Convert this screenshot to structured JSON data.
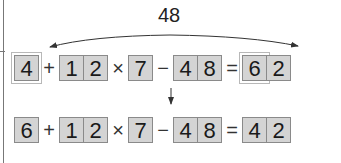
{
  "arc_label": "48",
  "top_equation": {
    "tokens": [
      {
        "type": "num",
        "digits": [
          "4"
        ],
        "highlighted": true
      },
      {
        "type": "op",
        "value": "+"
      },
      {
        "type": "num",
        "digits": [
          "1",
          "2"
        ]
      },
      {
        "type": "op",
        "value": "×"
      },
      {
        "type": "num",
        "digits": [
          "7"
        ]
      },
      {
        "type": "op",
        "value": "−"
      },
      {
        "type": "num",
        "digits": [
          "4",
          "8"
        ]
      },
      {
        "type": "op",
        "value": "="
      },
      {
        "type": "num",
        "digits": [
          "6",
          "2"
        ],
        "highlighted_digit": 0
      }
    ]
  },
  "bottom_equation": {
    "tokens": [
      {
        "type": "num",
        "digits": [
          "6"
        ]
      },
      {
        "type": "op",
        "value": "+"
      },
      {
        "type": "num",
        "digits": [
          "1",
          "2"
        ]
      },
      {
        "type": "op",
        "value": "×"
      },
      {
        "type": "num",
        "digits": [
          "7"
        ]
      },
      {
        "type": "op",
        "value": "−"
      },
      {
        "type": "num",
        "digits": [
          "4",
          "8"
        ]
      },
      {
        "type": "op",
        "value": "="
      },
      {
        "type": "num",
        "digits": [
          "4",
          "2"
        ]
      }
    ]
  },
  "colors": {
    "cell_fill": "#d4d4d4",
    "cell_border": "#8a8a8a",
    "arrow": "#333333"
  }
}
